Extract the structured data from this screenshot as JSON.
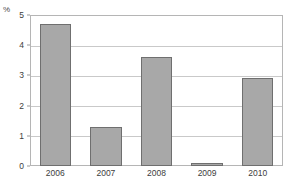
{
  "chart_data": {
    "type": "bar",
    "title": "",
    "subtitle": "",
    "xlabel": "",
    "ylabel": "%",
    "unit_label": "%",
    "categories": [
      "2006",
      "2007",
      "2008",
      "2009",
      "2010"
    ],
    "values": [
      4.7,
      1.3,
      3.6,
      0.1,
      2.9
    ],
    "series": [
      {
        "name": "",
        "values": [
          4.7,
          1.3,
          3.6,
          0.1,
          2.9
        ]
      }
    ],
    "ylim": [
      0,
      5
    ],
    "yticks": [
      0,
      1,
      2,
      3,
      4,
      5
    ],
    "ytick_labels": [
      "0",
      "1",
      "2",
      "3",
      "4",
      "5"
    ],
    "xtick_labels": [
      "2006",
      "2007",
      "2008",
      "2009",
      "2010"
    ],
    "grid": true,
    "grid_axis": "y",
    "legend": false,
    "legend_position": "none",
    "annotations": [],
    "colors": {
      "bar_fill": "#a8a8a8",
      "bar_border": "#6f6f6f",
      "gridline": "#c9c9c9",
      "frame": "#b5b5b5",
      "tick_text": "#3d3d3d",
      "unit_text": "#4a4a4a",
      "background": "#ffffff"
    }
  }
}
